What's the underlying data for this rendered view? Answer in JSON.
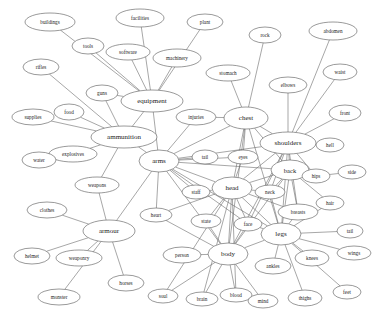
{
  "graph": {
    "title": "semantic association network",
    "type": "node-link-diagram",
    "style": {
      "node_fill": "#ffffff",
      "node_stroke": "#555555",
      "edge_stroke": "#6b6b6b",
      "label_color": "#1a1a1a",
      "background": "#ffffff"
    },
    "nodes": [
      {
        "id": "buildings",
        "label": "buildings",
        "x": 50,
        "y": 22,
        "rx": 25,
        "ry": 9,
        "fs": 5.2,
        "hub": false
      },
      {
        "id": "facilities",
        "label": "facilities",
        "x": 140,
        "y": 18,
        "rx": 24,
        "ry": 9,
        "fs": 5.2,
        "hub": false
      },
      {
        "id": "plant",
        "label": "plant",
        "x": 205,
        "y": 22,
        "rx": 18,
        "ry": 8,
        "fs": 5.2,
        "hub": false
      },
      {
        "id": "rock",
        "label": "rock",
        "x": 265,
        "y": 35,
        "rx": 16,
        "ry": 8,
        "fs": 5.2,
        "hub": false
      },
      {
        "id": "abdomen",
        "label": "abdomen",
        "x": 333,
        "y": 31,
        "rx": 24,
        "ry": 9,
        "fs": 5.2,
        "hub": false
      },
      {
        "id": "tools",
        "label": "tools",
        "x": 88,
        "y": 46,
        "rx": 16,
        "ry": 8,
        "fs": 5.2,
        "hub": false
      },
      {
        "id": "software",
        "label": "software",
        "x": 128,
        "y": 52,
        "rx": 22,
        "ry": 8,
        "fs": 5.2,
        "hub": false
      },
      {
        "id": "machinery",
        "label": "machinery",
        "x": 177,
        "y": 58,
        "rx": 24,
        "ry": 9,
        "fs": 5.2,
        "hub": false
      },
      {
        "id": "waist",
        "label": "waist",
        "x": 340,
        "y": 72,
        "rx": 17,
        "ry": 8,
        "fs": 5.2,
        "hub": false
      },
      {
        "id": "rifles",
        "label": "rifles",
        "x": 41,
        "y": 67,
        "rx": 18,
        "ry": 8,
        "fs": 5.2,
        "hub": false
      },
      {
        "id": "stomach",
        "label": "stomach",
        "x": 228,
        "y": 73,
        "rx": 22,
        "ry": 8,
        "fs": 5.2,
        "hub": false
      },
      {
        "id": "elbows",
        "label": "elbows",
        "x": 288,
        "y": 85,
        "rx": 19,
        "ry": 8,
        "fs": 5.2,
        "hub": false
      },
      {
        "id": "guns",
        "label": "guns",
        "x": 102,
        "y": 93,
        "rx": 16,
        "ry": 8,
        "fs": 5.2,
        "hub": false
      },
      {
        "id": "equipment",
        "label": "equipment",
        "x": 152,
        "y": 101,
        "rx": 31,
        "ry": 11,
        "fs": 7.0,
        "hub": true
      },
      {
        "id": "front",
        "label": "front",
        "x": 345,
        "y": 113,
        "rx": 16,
        "ry": 8,
        "fs": 5.2,
        "hub": false
      },
      {
        "id": "supplies",
        "label": "supplies",
        "x": 33,
        "y": 117,
        "rx": 21,
        "ry": 8,
        "fs": 5.2,
        "hub": false
      },
      {
        "id": "food",
        "label": "food",
        "x": 69,
        "y": 112,
        "rx": 15,
        "ry": 8,
        "fs": 5.2,
        "hub": false
      },
      {
        "id": "injuries",
        "label": "injuries",
        "x": 196,
        "y": 117,
        "rx": 20,
        "ry": 8,
        "fs": 5.2,
        "hub": false
      },
      {
        "id": "chest",
        "label": "chest",
        "x": 246,
        "y": 118,
        "rx": 22,
        "ry": 11,
        "fs": 7.0,
        "hub": true
      },
      {
        "id": "shoulders",
        "label": "shoulders",
        "x": 288,
        "y": 143,
        "rx": 28,
        "ry": 11,
        "fs": 7.0,
        "hub": true
      },
      {
        "id": "ammunition",
        "label": "ammunition",
        "x": 124,
        "y": 137,
        "rx": 33,
        "ry": 11,
        "fs": 7.0,
        "hub": true
      },
      {
        "id": "hell",
        "label": "hell",
        "x": 330,
        "y": 145,
        "rx": 14,
        "ry": 7,
        "fs": 5.2,
        "hub": false
      },
      {
        "id": "explosives",
        "label": "explosives",
        "x": 73,
        "y": 154,
        "rx": 24,
        "ry": 8,
        "fs": 5.2,
        "hub": false
      },
      {
        "id": "arms",
        "label": "arms",
        "x": 159,
        "y": 161,
        "rx": 20,
        "ry": 11,
        "fs": 7.0,
        "hub": true
      },
      {
        "id": "tail",
        "label": "tail",
        "x": 205,
        "y": 157,
        "rx": 13,
        "ry": 7,
        "fs": 5.2,
        "hub": false
      },
      {
        "id": "eyes",
        "label": "eyes",
        "x": 243,
        "y": 157,
        "rx": 15,
        "ry": 7,
        "fs": 5.2,
        "hub": false
      },
      {
        "id": "back",
        "label": "back",
        "x": 290,
        "y": 170,
        "rx": 19,
        "ry": 10,
        "fs": 6.5,
        "hub": true
      },
      {
        "id": "hips",
        "label": "hips",
        "x": 316,
        "y": 176,
        "rx": 14,
        "ry": 7,
        "fs": 5.2,
        "hub": false
      },
      {
        "id": "side",
        "label": "side",
        "x": 352,
        "y": 172,
        "rx": 14,
        "ry": 7,
        "fs": 5.2,
        "hub": false
      },
      {
        "id": "water",
        "label": "water",
        "x": 39,
        "y": 160,
        "rx": 17,
        "ry": 8,
        "fs": 5.2,
        "hub": false
      },
      {
        "id": "weapons",
        "label": "weapons",
        "x": 97,
        "y": 185,
        "rx": 22,
        "ry": 8,
        "fs": 5.2,
        "hub": false
      },
      {
        "id": "staff",
        "label": "staff",
        "x": 196,
        "y": 192,
        "rx": 14,
        "ry": 7,
        "fs": 5.2,
        "hub": false
      },
      {
        "id": "head",
        "label": "head",
        "x": 232,
        "y": 188,
        "rx": 20,
        "ry": 11,
        "fs": 7.0,
        "hub": true
      },
      {
        "id": "neck",
        "label": "neck",
        "x": 270,
        "y": 192,
        "rx": 15,
        "ry": 7,
        "fs": 5.2,
        "hub": false
      },
      {
        "id": "hair",
        "label": "hair",
        "x": 330,
        "y": 203,
        "rx": 14,
        "ry": 7,
        "fs": 5.2,
        "hub": false
      },
      {
        "id": "clothes",
        "label": "clothes",
        "x": 47,
        "y": 210,
        "rx": 20,
        "ry": 8,
        "fs": 5.2,
        "hub": false
      },
      {
        "id": "heart",
        "label": "heart",
        "x": 156,
        "y": 215,
        "rx": 16,
        "ry": 7,
        "fs": 5.2,
        "hub": false
      },
      {
        "id": "state",
        "label": "state",
        "x": 206,
        "y": 221,
        "rx": 15,
        "ry": 7,
        "fs": 5.2,
        "hub": false
      },
      {
        "id": "face",
        "label": "face",
        "x": 248,
        "y": 224,
        "rx": 14,
        "ry": 7,
        "fs": 5.2,
        "hub": false
      },
      {
        "id": "breasts",
        "label": "breasts",
        "x": 298,
        "y": 212,
        "rx": 20,
        "ry": 8,
        "fs": 5.2,
        "hub": false
      },
      {
        "id": "legs",
        "label": "legs",
        "x": 281,
        "y": 234,
        "rx": 20,
        "ry": 11,
        "fs": 7.0,
        "hub": true
      },
      {
        "id": "tail2",
        "label": "tail",
        "x": 350,
        "y": 231,
        "rx": 13,
        "ry": 7,
        "fs": 5.2,
        "hub": false
      },
      {
        "id": "armour",
        "label": "armour",
        "x": 109,
        "y": 231,
        "rx": 26,
        "ry": 11,
        "fs": 7.0,
        "hub": true
      },
      {
        "id": "helmet",
        "label": "helmet",
        "x": 32,
        "y": 256,
        "rx": 18,
        "ry": 8,
        "fs": 5.2,
        "hub": false
      },
      {
        "id": "weaponry",
        "label": "weaponry",
        "x": 79,
        "y": 258,
        "rx": 23,
        "ry": 8,
        "fs": 5.2,
        "hub": false
      },
      {
        "id": "person",
        "label": "person",
        "x": 182,
        "y": 255,
        "rx": 19,
        "ry": 8,
        "fs": 5.2,
        "hub": false
      },
      {
        "id": "body",
        "label": "body",
        "x": 228,
        "y": 254,
        "rx": 20,
        "ry": 11,
        "fs": 7.0,
        "hub": true
      },
      {
        "id": "ankles",
        "label": "ankles",
        "x": 273,
        "y": 266,
        "rx": 18,
        "ry": 8,
        "fs": 5.2,
        "hub": false
      },
      {
        "id": "knees",
        "label": "knees",
        "x": 312,
        "y": 258,
        "rx": 17,
        "ry": 8,
        "fs": 5.2,
        "hub": false
      },
      {
        "id": "wings",
        "label": "wings",
        "x": 354,
        "y": 253,
        "rx": 17,
        "ry": 7,
        "fs": 5.2,
        "hub": false
      },
      {
        "id": "horses",
        "label": "horses",
        "x": 126,
        "y": 283,
        "rx": 18,
        "ry": 8,
        "fs": 5.2,
        "hub": false
      },
      {
        "id": "monster",
        "label": "monster",
        "x": 59,
        "y": 297,
        "rx": 21,
        "ry": 8,
        "fs": 5.2,
        "hub": false
      },
      {
        "id": "soul",
        "label": "soul",
        "x": 163,
        "y": 296,
        "rx": 15,
        "ry": 7,
        "fs": 5.2,
        "hub": false
      },
      {
        "id": "brain",
        "label": "brain",
        "x": 202,
        "y": 299,
        "rx": 16,
        "ry": 7,
        "fs": 5.2,
        "hub": false
      },
      {
        "id": "blood",
        "label": "blood",
        "x": 236,
        "y": 295,
        "rx": 16,
        "ry": 7,
        "fs": 5.2,
        "hub": false
      },
      {
        "id": "mind",
        "label": "mind",
        "x": 263,
        "y": 301,
        "rx": 15,
        "ry": 7,
        "fs": 5.2,
        "hub": false
      },
      {
        "id": "thighs",
        "label": "thighs",
        "x": 305,
        "y": 298,
        "rx": 17,
        "ry": 8,
        "fs": 5.2,
        "hub": false
      },
      {
        "id": "feet",
        "label": "feet",
        "x": 347,
        "y": 292,
        "rx": 14,
        "ry": 7,
        "fs": 5.2,
        "hub": false
      }
    ],
    "edges": [
      [
        "buildings",
        "equipment"
      ],
      [
        "facilities",
        "equipment"
      ],
      [
        "tools",
        "equipment"
      ],
      [
        "software",
        "equipment"
      ],
      [
        "machinery",
        "equipment"
      ],
      [
        "plant",
        "equipment"
      ],
      [
        "guns",
        "ammunition"
      ],
      [
        "guns",
        "equipment"
      ],
      [
        "rifles",
        "ammunition"
      ],
      [
        "supplies",
        "ammunition"
      ],
      [
        "food",
        "ammunition"
      ],
      [
        "explosives",
        "ammunition"
      ],
      [
        "water",
        "explosives"
      ],
      [
        "equipment",
        "ammunition"
      ],
      [
        "equipment",
        "arms"
      ],
      [
        "ammunition",
        "arms"
      ],
      [
        "ammunition",
        "weapons"
      ],
      [
        "weapons",
        "armour"
      ],
      [
        "arms",
        "armour"
      ],
      [
        "clothes",
        "armour"
      ],
      [
        "helmet",
        "armour"
      ],
      [
        "weaponry",
        "armour"
      ],
      [
        "monster",
        "armour"
      ],
      [
        "horses",
        "armour"
      ],
      [
        "arms",
        "injuries"
      ],
      [
        "arms",
        "tail"
      ],
      [
        "arms",
        "chest"
      ],
      [
        "arms",
        "shoulders"
      ],
      [
        "arms",
        "head"
      ],
      [
        "arms",
        "legs"
      ],
      [
        "arms",
        "body"
      ],
      [
        "arms",
        "eyes"
      ],
      [
        "arms",
        "face"
      ],
      [
        "arms",
        "heart"
      ],
      [
        "arms",
        "staff"
      ],
      [
        "arms",
        "back"
      ],
      [
        "stomach",
        "chest"
      ],
      [
        "rock",
        "chest"
      ],
      [
        "chest",
        "shoulders"
      ],
      [
        "chest",
        "head"
      ],
      [
        "chest",
        "back"
      ],
      [
        "chest",
        "legs"
      ],
      [
        "chest",
        "eyes"
      ],
      [
        "chest",
        "body"
      ],
      [
        "chest",
        "injuries"
      ],
      [
        "elbows",
        "shoulders"
      ],
      [
        "abdomen",
        "shoulders"
      ],
      [
        "waist",
        "shoulders"
      ],
      [
        "front",
        "shoulders"
      ],
      [
        "hell",
        "shoulders"
      ],
      [
        "shoulders",
        "back"
      ],
      [
        "shoulders",
        "head"
      ],
      [
        "shoulders",
        "legs"
      ],
      [
        "shoulders",
        "neck"
      ],
      [
        "shoulders",
        "face"
      ],
      [
        "shoulders",
        "body"
      ],
      [
        "shoulders",
        "breasts"
      ],
      [
        "shoulders",
        "hips"
      ],
      [
        "back",
        "hips"
      ],
      [
        "hips",
        "side"
      ],
      [
        "back",
        "legs"
      ],
      [
        "back",
        "head"
      ],
      [
        "back",
        "neck"
      ],
      [
        "back",
        "hair"
      ],
      [
        "back",
        "breasts"
      ],
      [
        "back",
        "body"
      ],
      [
        "head",
        "neck"
      ],
      [
        "head",
        "face"
      ],
      [
        "head",
        "legs"
      ],
      [
        "head",
        "body"
      ],
      [
        "head",
        "state"
      ],
      [
        "head",
        "staff"
      ],
      [
        "head",
        "eyes"
      ],
      [
        "head",
        "breasts"
      ],
      [
        "head",
        "heart"
      ],
      [
        "head",
        "brain"
      ],
      [
        "head",
        "soul"
      ],
      [
        "head",
        "blood"
      ],
      [
        "legs",
        "body"
      ],
      [
        "legs",
        "face"
      ],
      [
        "legs",
        "ankles"
      ],
      [
        "legs",
        "knees"
      ],
      [
        "legs",
        "thighs"
      ],
      [
        "legs",
        "feet"
      ],
      [
        "legs",
        "wings"
      ],
      [
        "legs",
        "tail2"
      ],
      [
        "legs",
        "hair"
      ],
      [
        "legs",
        "breasts"
      ],
      [
        "legs",
        "neck"
      ],
      [
        "body",
        "person"
      ],
      [
        "body",
        "soul"
      ],
      [
        "body",
        "brain"
      ],
      [
        "body",
        "blood"
      ],
      [
        "body",
        "mind"
      ],
      [
        "body",
        "face"
      ],
      [
        "body",
        "state"
      ],
      [
        "body",
        "heart"
      ]
    ]
  }
}
